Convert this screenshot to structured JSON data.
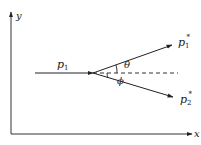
{
  "diagram": {
    "title": "",
    "axes": {
      "x_label": "x",
      "y_label": "y"
    },
    "vectors": {
      "incoming": {
        "label": "p",
        "subscript": "1",
        "superscript": ""
      },
      "outgoing_1": {
        "label": "p",
        "subscript": "1",
        "superscript": "*"
      },
      "outgoing_2": {
        "label": "p",
        "subscript": "2",
        "superscript": "*"
      }
    },
    "angles": {
      "theta": "θ",
      "phi": "ϕ"
    },
    "colors": {
      "line": "#222222",
      "background": "#ffffff"
    }
  }
}
